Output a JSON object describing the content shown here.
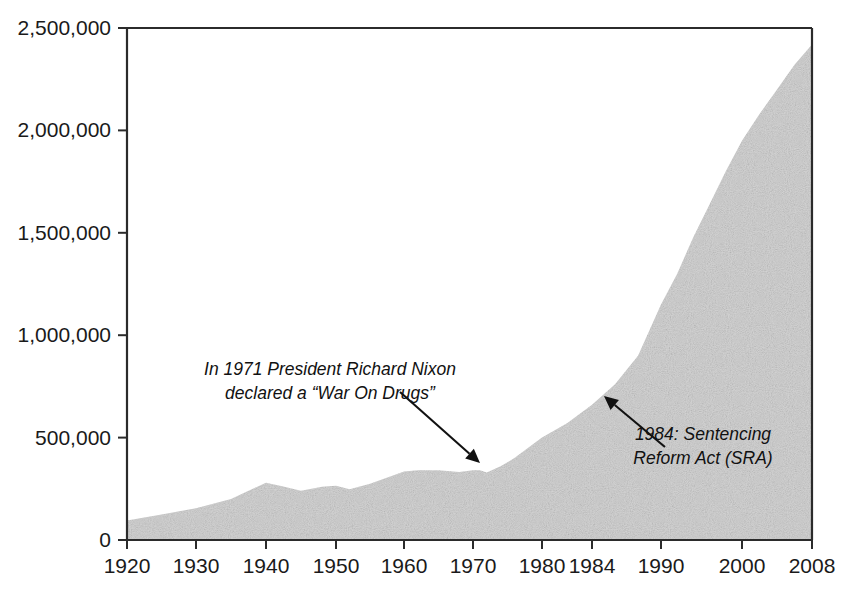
{
  "chart_data": {
    "type": "area",
    "title": "",
    "subtitle": "",
    "xlabel": "",
    "ylabel": "",
    "xlim": [
      1920,
      2008
    ],
    "ylim": [
      0,
      2500000
    ],
    "grid": false,
    "legend": "none",
    "fill_color": "#d4d4d4",
    "axis_color": "#2b2b2b",
    "x_tick_labels": [
      "1920",
      "1930",
      "1940",
      "1950",
      "1960",
      "1970",
      "1980",
      "1984",
      "1990",
      "2000",
      "2008"
    ],
    "x_tick_values": [
      1920,
      1930,
      1940,
      1950,
      1960,
      1970,
      1980,
      1984,
      1990,
      2000,
      2008
    ],
    "x_tick_pixels": [
      127,
      196,
      266,
      336,
      404,
      473,
      542,
      592,
      661,
      742,
      812
    ],
    "y_tick_labels": [
      "0",
      "500,000",
      "1,000,000",
      "1,500,000",
      "2,000,000",
      "2,500,000"
    ],
    "y_tick_values": [
      0,
      500000,
      1000000,
      1500000,
      2000000,
      2500000
    ],
    "series": [
      {
        "name": "U.S. prison population",
        "x": [
          1920,
          1925,
          1930,
          1935,
          1940,
          1942,
          1945,
          1948,
          1950,
          1952,
          1955,
          1960,
          1962,
          1965,
          1968,
          1970,
          1971,
          1972,
          1974,
          1976,
          1978,
          1980,
          1982,
          1984,
          1986,
          1988,
          1990,
          1992,
          1994,
          1996,
          1998,
          2000,
          2002,
          2004,
          2006,
          2008
        ],
        "y": [
          95000,
          125000,
          155000,
          200000,
          280000,
          265000,
          240000,
          260000,
          265000,
          248000,
          275000,
          335000,
          340000,
          340000,
          332000,
          340000,
          340000,
          330000,
          360000,
          400000,
          450000,
          500000,
          570000,
          660000,
          760000,
          900000,
          1150000,
          1300000,
          1480000,
          1640000,
          1800000,
          1950000,
          2080000,
          2200000,
          2320000,
          2420000
        ]
      }
    ],
    "annotations": [
      {
        "id": "nixon-war-on-drugs",
        "lines": [
          "In 1971 President Richard Nixon",
          "declared a “War On Drugs”"
        ],
        "text_x": 330,
        "text_y": 375,
        "arrow_from": [
          400,
          392
        ],
        "arrow_to": [
          480,
          463
        ]
      },
      {
        "id": "sentencing-reform-act",
        "lines": [
          "1984: Sentencing",
          "Reform Act (SRA)"
        ],
        "text_x": 703,
        "text_y": 440,
        "arrow_from": [
          665,
          447
        ],
        "arrow_to": [
          604,
          396
        ]
      }
    ]
  }
}
